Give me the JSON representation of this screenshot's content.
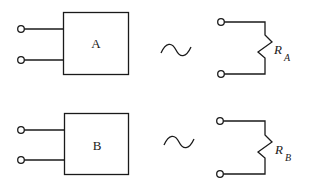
{
  "diagram": {
    "type": "circuit-equivalence",
    "rows": [
      {
        "box_label": "A",
        "equivalence_symbol": "~",
        "resistor_label": "R",
        "resistor_subscript": "A"
      },
      {
        "box_label": "B",
        "equivalence_symbol": "~",
        "resistor_label": "R",
        "resistor_subscript": "B"
      }
    ],
    "colors": {
      "stroke": "#1a1a1a",
      "background": "#ffffff"
    }
  }
}
